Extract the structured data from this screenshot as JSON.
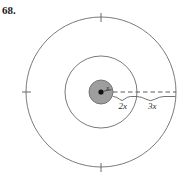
{
  "figure": {
    "problem_number": "68.",
    "center_radius_label": "x",
    "middle_band_label": "2x",
    "outer_band_label": "3x",
    "colors": {
      "stroke": "#6b6b6b",
      "inner_fill": "#9e9e9e",
      "inner_stroke": "#6e6e6e",
      "center_dot": "#111111",
      "dashed_line": "#4a4a4a",
      "text": "#1a1a1a",
      "background": "#ffffff"
    },
    "geometry": {
      "center_x": 101,
      "center_y": 92,
      "inner_radius": 12,
      "middle_radius": 36,
      "outer_radius": 75
    },
    "tick_marks": [
      "top",
      "left",
      "bottom"
    ]
  }
}
